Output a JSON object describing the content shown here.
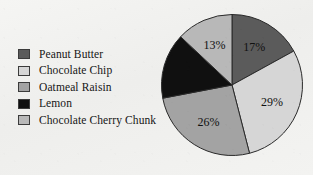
{
  "chart_data": {
    "type": "pie",
    "title": "",
    "categories": [
      "Peanut Butter",
      "Chocolate Chip",
      "Oatmeal Raisin",
      "Lemon",
      "Chocolate Cherry Chunk"
    ],
    "values": [
      17,
      29,
      26,
      15,
      13
    ],
    "value_labels": [
      "17%",
      "29%",
      "26%",
      "15%",
      "13%"
    ],
    "unit": "%",
    "start_angle_deg": 0,
    "direction": "clockwise",
    "legend_position": "left",
    "grid": false,
    "colors": [
      "#5b5b5b",
      "#d6d6d6",
      "#a3a3a3",
      "#101010",
      "#b8b8b8"
    ],
    "slice_label_colors": [
      "#111111",
      "#111111",
      "#111111",
      "#ffffff",
      "#111111"
    ],
    "slice_outline_color": "#2a2a2a",
    "background_color": "#f1f1ef"
  },
  "legend": {
    "items": [
      {
        "label": "Peanut Butter",
        "color": "#5b5b5b"
      },
      {
        "label": "Chocolate Chip",
        "color": "#d6d6d6"
      },
      {
        "label": "Oatmeal Raisin",
        "color": "#a3a3a3"
      },
      {
        "label": "Lemon",
        "color": "#101010"
      },
      {
        "label": "Chocolate Cherry Chunk",
        "color": "#b8b8b8"
      }
    ]
  }
}
